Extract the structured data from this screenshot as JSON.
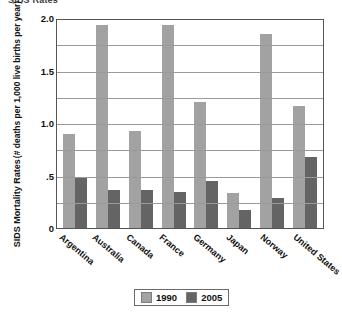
{
  "title_strip": "SIDS Rates",
  "chart_data": {
    "type": "bar",
    "title": "SIDS Rates",
    "xlabel": "",
    "ylabel": "SIDS Mortality Rates",
    "ylabel_line1": "SIDS Mortality Rates",
    "ylabel_line2": "(# deaths per 1,000 live births per year)",
    "ylim": [
      0,
      2.0
    ],
    "yticks": [
      0,
      0.5,
      1.0,
      1.5,
      2.0
    ],
    "ytick_labels": [
      "0",
      ".5",
      "1.0",
      "1.5",
      "2.0"
    ],
    "grid": true,
    "grid_minor": true,
    "legend_position": "bottom-center",
    "categories": [
      "Argentina",
      "Australia",
      "Canada",
      "France",
      "Germany",
      "Japan",
      "Norway",
      "United States"
    ],
    "series": [
      {
        "name": "1990",
        "color": "#a2a2a2",
        "values": [
          0.9,
          1.93,
          0.92,
          1.93,
          1.2,
          0.33,
          1.85,
          1.16
        ]
      },
      {
        "name": "2005",
        "color": "#646464",
        "values": [
          0.48,
          0.36,
          0.36,
          0.34,
          0.45,
          0.17,
          0.29,
          0.68
        ]
      }
    ]
  },
  "legend": {
    "items": [
      {
        "label": "1990",
        "color": "#a2a2a2"
      },
      {
        "label": "2005",
        "color": "#646464"
      }
    ]
  },
  "colors": {
    "series_1990": "#a2a2a2",
    "series_2005": "#646464",
    "axis": "#555555",
    "grid": "#9a9a9a",
    "background": "#ffffff",
    "text": "#111111"
  }
}
